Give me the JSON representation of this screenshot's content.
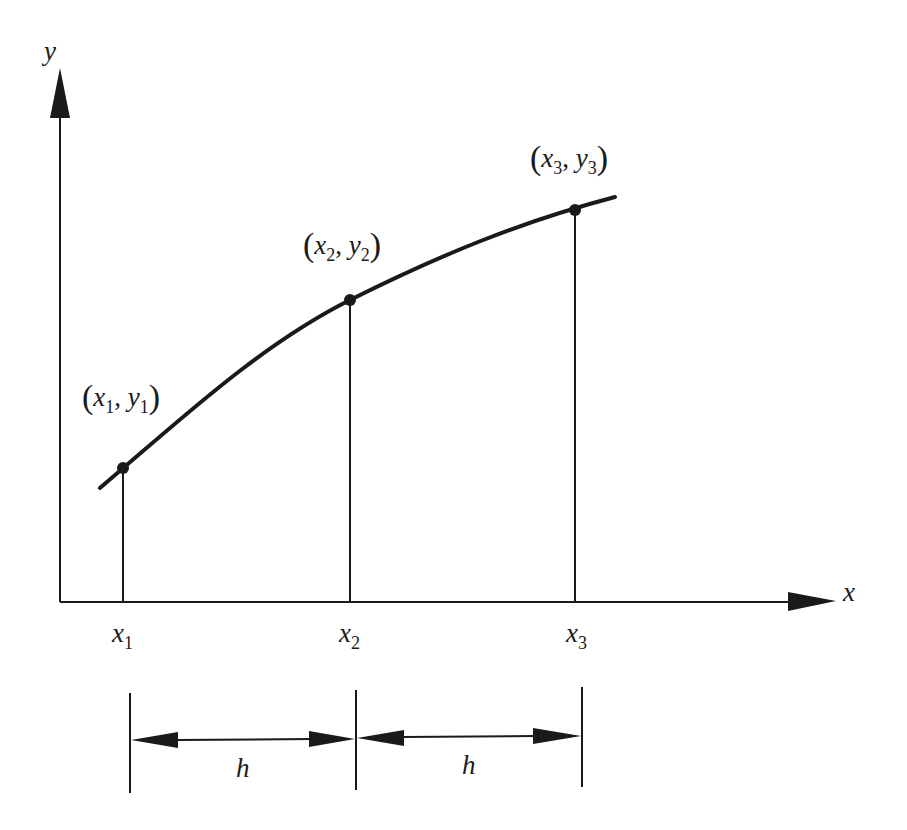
{
  "diagram": {
    "type": "function-sampling-diagram",
    "colors": {
      "ink": "#1a1a1a",
      "background": "#ffffff"
    },
    "axes": {
      "x_label": "x",
      "y_label": "y"
    },
    "points": [
      {
        "id": "p1",
        "x": "x",
        "x_sub": "1",
        "y": "y",
        "y_sub": "1",
        "open": "(",
        "comma": ",",
        "close": ")"
      },
      {
        "id": "p2",
        "x": "x",
        "x_sub": "2",
        "y": "y",
        "y_sub": "2",
        "open": "(",
        "comma": ",",
        "close": ")"
      },
      {
        "id": "p3",
        "x": "x",
        "x_sub": "3",
        "y": "y",
        "y_sub": "3",
        "open": "(",
        "comma": ",",
        "close": ")"
      }
    ],
    "x_ticks": [
      {
        "base": "x",
        "sub": "1"
      },
      {
        "base": "x",
        "sub": "2"
      },
      {
        "base": "x",
        "sub": "3"
      }
    ],
    "spacing": [
      {
        "label": "h"
      },
      {
        "label": "h"
      }
    ]
  }
}
